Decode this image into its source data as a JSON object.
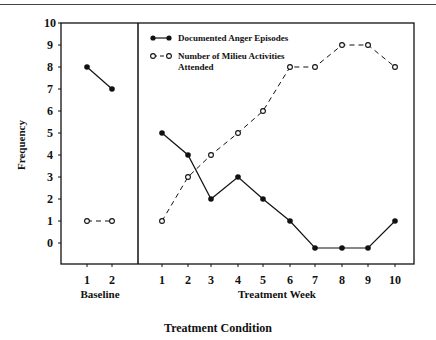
{
  "chart_data": {
    "type": "line",
    "title": "",
    "xlabel": "Treatment Condition",
    "ylabel": "Frequency",
    "ylim": [
      -1,
      10
    ],
    "yticks": [
      0,
      1,
      2,
      3,
      4,
      5,
      6,
      7,
      8,
      9,
      10
    ],
    "grid": false,
    "legend_position": "top-left of treatment panel",
    "panels": [
      {
        "name": "Baseline",
        "x": [
          1,
          2
        ],
        "series": [
          {
            "name": "Documented Anger Episodes",
            "values": [
              8,
              7
            ]
          },
          {
            "name": "Number of Milieu Activities Attended",
            "values": [
              1,
              1
            ]
          }
        ]
      },
      {
        "name": "Treatment Week",
        "x": [
          1,
          2,
          3,
          4,
          5,
          6,
          7,
          8,
          9,
          10
        ],
        "series": [
          {
            "name": "Documented Anger Episodes",
            "values": [
              5,
              4,
              2,
              3,
              2,
              1,
              0,
              0,
              0,
              1
            ]
          },
          {
            "name": "Number of Milieu Activities Attended",
            "values": [
              1,
              3,
              4,
              5,
              6,
              8,
              8,
              9,
              9,
              8
            ]
          }
        ]
      }
    ],
    "legend": [
      {
        "label": "Documented Anger Episodes",
        "marker": "filled-circle",
        "line": "solid"
      },
      {
        "label": "Number of Milieu Activities Attended",
        "marker": "open-circle",
        "line": "dashed"
      }
    ]
  },
  "labels": {
    "ylabel": "Frequency",
    "baseline": "Baseline",
    "treatment_week": "Treatment Week",
    "condition": "Treatment Condition",
    "legend1": "Documented Anger Episodes",
    "legend2a": "Number of Milieu Activities",
    "legend2b": "Attended"
  }
}
